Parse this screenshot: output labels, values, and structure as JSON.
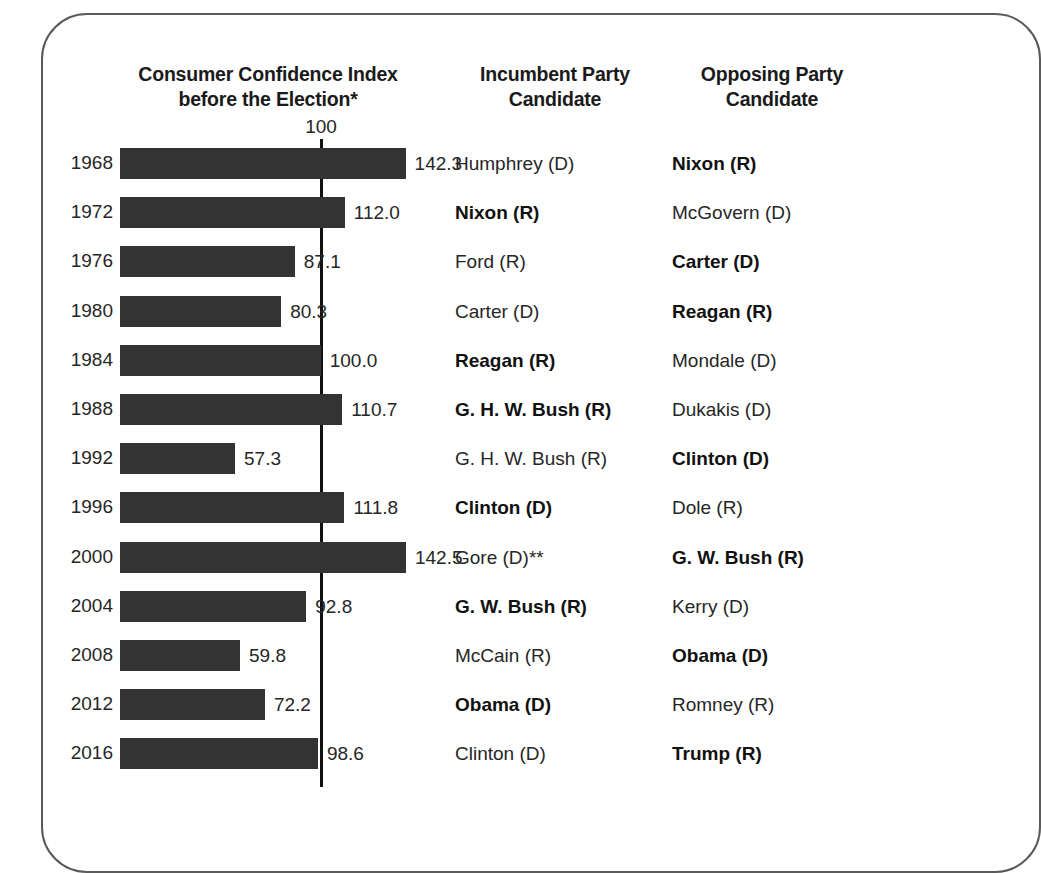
{
  "headers": {
    "chart": "Consumer Confidence Index before the Election*",
    "chart_line1": "Consumer Confidence Index",
    "chart_line2": "before the Election*",
    "incumbent": "Incumbent Party Candidate",
    "incumbent_line1": "Incumbent Party",
    "incumbent_line2": "Candidate",
    "opposing": "Opposing Party Candidate",
    "opposing_line1": "Opposing Party",
    "opposing_line2": "Candidate"
  },
  "reference": {
    "label": "100",
    "value": 100
  },
  "colors": {
    "bar": "#333333",
    "reference_line": "#111111",
    "text": "#262626",
    "frame": "#5a5a5a"
  },
  "chart_data": {
    "type": "bar",
    "orientation": "horizontal",
    "title": "Consumer Confidence Index before the Election*",
    "xlabel": "Consumer Confidence Index",
    "ylabel": "Election Year",
    "xlim": [
      0,
      150
    ],
    "grid": false,
    "legend": false,
    "reference_line": 100,
    "categories": [
      1968,
      1972,
      1976,
      1980,
      1984,
      1988,
      1992,
      1996,
      2000,
      2004,
      2008,
      2012,
      2016
    ],
    "values": [
      142.3,
      112.0,
      87.1,
      80.3,
      100.0,
      110.7,
      57.3,
      111.8,
      142.5,
      92.8,
      59.8,
      72.2,
      98.6
    ],
    "value_labels": [
      "142.3",
      "112.0",
      "87.1",
      "80.3",
      "100.0",
      "110.7",
      "57.3",
      "111.8",
      "142.5",
      "92.8",
      "59.8",
      "72.2",
      "98.6"
    ]
  },
  "rows": [
    {
      "year": "1968",
      "value": 142.3,
      "value_label": "142.3",
      "incumbent": "Humphrey (D)",
      "incumbent_winner": false,
      "opposing": "Nixon (R)",
      "opposing_winner": true
    },
    {
      "year": "1972",
      "value": 112.0,
      "value_label": "112.0",
      "incumbent": "Nixon (R)",
      "incumbent_winner": true,
      "opposing": "McGovern (D)",
      "opposing_winner": false
    },
    {
      "year": "1976",
      "value": 87.1,
      "value_label": "87.1",
      "incumbent": "Ford (R)",
      "incumbent_winner": false,
      "opposing": "Carter (D)",
      "opposing_winner": true
    },
    {
      "year": "1980",
      "value": 80.3,
      "value_label": "80.3",
      "incumbent": "Carter (D)",
      "incumbent_winner": false,
      "opposing": "Reagan (R)",
      "opposing_winner": true
    },
    {
      "year": "1984",
      "value": 100.0,
      "value_label": "100.0",
      "incumbent": "Reagan (R)",
      "incumbent_winner": true,
      "opposing": "Mondale (D)",
      "opposing_winner": false
    },
    {
      "year": "1988",
      "value": 110.7,
      "value_label": "110.7",
      "incumbent": "G. H. W. Bush (R)",
      "incumbent_winner": true,
      "opposing": "Dukakis (D)",
      "opposing_winner": false
    },
    {
      "year": "1992",
      "value": 57.3,
      "value_label": "57.3",
      "incumbent": "G. H. W. Bush (R)",
      "incumbent_winner": false,
      "opposing": "Clinton (D)",
      "opposing_winner": true
    },
    {
      "year": "1996",
      "value": 111.8,
      "value_label": "111.8",
      "incumbent": "Clinton (D)",
      "incumbent_winner": true,
      "opposing": "Dole (R)",
      "opposing_winner": false
    },
    {
      "year": "2000",
      "value": 142.5,
      "value_label": "142.5",
      "incumbent": "Gore (D)**",
      "incumbent_winner": false,
      "opposing": "G. W. Bush (R)",
      "opposing_winner": true
    },
    {
      "year": "2004",
      "value": 92.8,
      "value_label": "92.8",
      "incumbent": "G. W. Bush (R)",
      "incumbent_winner": true,
      "opposing": "Kerry (D)",
      "opposing_winner": false
    },
    {
      "year": "2008",
      "value": 59.8,
      "value_label": "59.8",
      "incumbent": "McCain (R)",
      "incumbent_winner": false,
      "opposing": "Obama (D)",
      "opposing_winner": true
    },
    {
      "year": "2012",
      "value": 72.2,
      "value_label": "72.2",
      "incumbent": "Obama (D)",
      "incumbent_winner": true,
      "opposing": "Romney (R)",
      "opposing_winner": false
    },
    {
      "year": "2016",
      "value": 98.6,
      "value_label": "98.6",
      "incumbent": "Clinton (D)",
      "incumbent_winner": false,
      "opposing": "Trump (R)",
      "opposing_winner": true
    }
  ]
}
